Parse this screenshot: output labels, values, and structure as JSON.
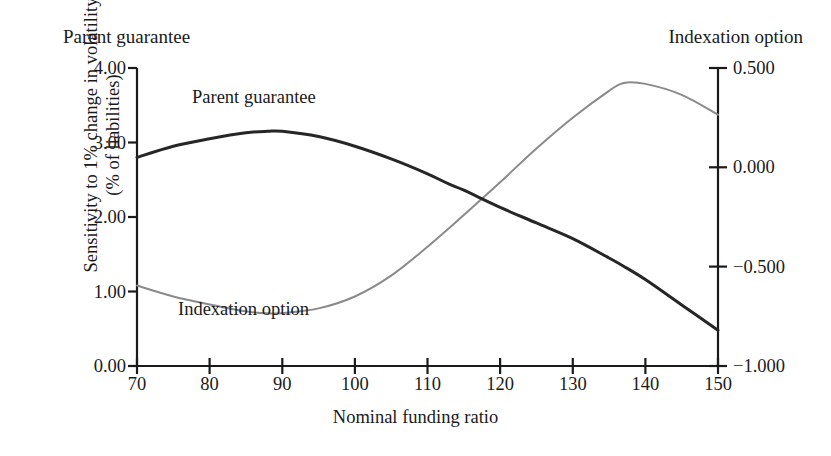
{
  "figure": {
    "top_left_label": "Parent guarantee",
    "top_right_label": "Indexation option"
  },
  "chart_data": {
    "type": "line",
    "title": "",
    "xlabel": "Nominal funding ratio",
    "ylabel_line1": "Sensitivity to 1% change in volatility",
    "ylabel_line2": "(% of liabilities)",
    "ylabel_right": "Indexation option",
    "ylabel_left_header": "Parent guarantee",
    "grid": false,
    "legend_position": "inline-annotation",
    "xlim": [
      70,
      150
    ],
    "xticks": [
      70,
      80,
      90,
      100,
      110,
      120,
      130,
      140,
      150
    ],
    "xtick_labels": [
      "70",
      "80",
      "90",
      "100",
      "110",
      "120",
      "130",
      "140",
      "150"
    ],
    "ylim_left": [
      0.0,
      4.0
    ],
    "yticks_left": [
      0.0,
      1.0,
      2.0,
      3.0,
      4.0
    ],
    "ytick_labels_left": [
      "0.00",
      "1.00",
      "2.00",
      "3.00",
      "4.00"
    ],
    "ylim_right": [
      -1.0,
      0.5
    ],
    "yticks_right": [
      -1.0,
      -0.5,
      0.0,
      0.5
    ],
    "ytick_labels_right": [
      "−1.000",
      "−0.500",
      "0.000",
      "0.500"
    ],
    "x": [
      70,
      75,
      80,
      85,
      88,
      90,
      95,
      100,
      105,
      110,
      113,
      115,
      120,
      125,
      130,
      135,
      137,
      140,
      145,
      150
    ],
    "series": [
      {
        "name": "Parent guarantee",
        "axis": "left",
        "color": "#262626",
        "width": 3.0,
        "annotation": "Parent guarantee",
        "values": [
          2.8,
          2.95,
          3.05,
          3.13,
          3.15,
          3.15,
          3.08,
          2.95,
          2.78,
          2.58,
          2.44,
          2.36,
          2.13,
          1.92,
          1.71,
          1.45,
          1.34,
          1.16,
          0.82,
          0.48
        ]
      },
      {
        "name": "Indexation option",
        "axis": "right",
        "color": "#8a8a8a",
        "width": 2.0,
        "annotation": "Indexation option",
        "values": [
          -0.595,
          -0.65,
          -0.69,
          -0.725,
          -0.735,
          -0.734,
          -0.71,
          -0.65,
          -0.545,
          -0.4,
          -0.305,
          -0.24,
          -0.075,
          0.095,
          0.25,
          0.385,
          0.425,
          0.42,
          0.365,
          0.265
        ]
      }
    ],
    "crossing_point": {
      "x": 113,
      "y_left": 2.44,
      "y_right": -0.305
    }
  }
}
